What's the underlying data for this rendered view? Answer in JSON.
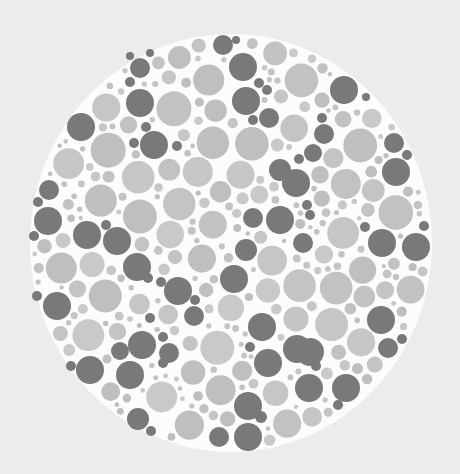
{
  "image": {
    "width": 460,
    "height": 474,
    "description": "Grayscale dot color-vision test plate"
  },
  "colors": {
    "background": "#ececec",
    "plate": "#fcfcfc",
    "light_dots": [
      "#c2c2c2",
      "#c6c6c6",
      "#bfbfbf",
      "#c9c9c9",
      "#c4c4c4"
    ],
    "dark_dot": "#797979"
  },
  "plate": {
    "cx": 231,
    "cy": 243,
    "rx": 201,
    "ry": 209
  },
  "dark_dots": [
    [
      223,
      45,
      10
    ],
    [
      236,
      40,
      4
    ],
    [
      243,
      67,
      14
    ],
    [
      259,
      83,
      5
    ],
    [
      267,
      90,
      5
    ],
    [
      246,
      101,
      14
    ],
    [
      269,
      118,
      10
    ],
    [
      253,
      120,
      5
    ],
    [
      140,
      68,
      10
    ],
    [
      130,
      56,
      4
    ],
    [
      150,
      53,
      4
    ],
    [
      140,
      103,
      14
    ],
    [
      130,
      82,
      5
    ],
    [
      81,
      127,
      14
    ],
    [
      146,
      127,
      5
    ],
    [
      154,
      145,
      14
    ],
    [
      134,
      143,
      5
    ],
    [
      177,
      146,
      5
    ],
    [
      344,
      90,
      14
    ],
    [
      366,
      97,
      4
    ],
    [
      322,
      118,
      5
    ],
    [
      324,
      134,
      10
    ],
    [
      313,
      153,
      9
    ],
    [
      299,
      159,
      5
    ],
    [
      394,
      143,
      10
    ],
    [
      407,
      155,
      5
    ],
    [
      396,
      172,
      14
    ],
    [
      296,
      183,
      14
    ],
    [
      307,
      205,
      5
    ],
    [
      310,
      215,
      5
    ],
    [
      280,
      170,
      11
    ],
    [
      253,
      218,
      10
    ],
    [
      280,
      220,
      14
    ],
    [
      246,
      250,
      11
    ],
    [
      49,
      190,
      10
    ],
    [
      38,
      202,
      5
    ],
    [
      48,
      221,
      14
    ],
    [
      34,
      236,
      5
    ],
    [
      87,
      235,
      14
    ],
    [
      106,
      225,
      5
    ],
    [
      117,
      241,
      14
    ],
    [
      137,
      267,
      14
    ],
    [
      148,
      278,
      5
    ],
    [
      303,
      243,
      10
    ],
    [
      365,
      227,
      5
    ],
    [
      424,
      226,
      5
    ],
    [
      382,
      243,
      14
    ],
    [
      416,
      247,
      14
    ],
    [
      234,
      279,
      14
    ],
    [
      161,
      282,
      5
    ],
    [
      178,
      291,
      14
    ],
    [
      195,
      300,
      5
    ],
    [
      194,
      316,
      10
    ],
    [
      163,
      337,
      5
    ],
    [
      262,
      327,
      14
    ],
    [
      250,
      347,
      5
    ],
    [
      297,
      349,
      14
    ],
    [
      57,
      306,
      14
    ],
    [
      37,
      296,
      5
    ],
    [
      150,
      318,
      5
    ],
    [
      142,
      345,
      14
    ],
    [
      120,
      351,
      9
    ],
    [
      169,
      353,
      10
    ],
    [
      163,
      363,
      5
    ],
    [
      71,
      366,
      5
    ],
    [
      90,
      370,
      14
    ],
    [
      130,
      375,
      14
    ],
    [
      381,
      320,
      14
    ],
    [
      402,
      339,
      5
    ],
    [
      388,
      348,
      10
    ],
    [
      310,
      352,
      14
    ],
    [
      316,
      366,
      5
    ],
    [
      268,
      363,
      14
    ],
    [
      309,
      388,
      14
    ],
    [
      346,
      388,
      14
    ],
    [
      338,
      405,
      5
    ],
    [
      248,
      406,
      14
    ],
    [
      261,
      417,
      6
    ],
    [
      219,
      437,
      10
    ],
    [
      248,
      437,
      14
    ],
    [
      138,
      419,
      11
    ],
    [
      151,
      431,
      5
    ]
  ],
  "light_packing": {
    "seed": 7,
    "attempts": 9000,
    "min_r": 2.5,
    "max_r": 16,
    "gap": 1.6
  }
}
